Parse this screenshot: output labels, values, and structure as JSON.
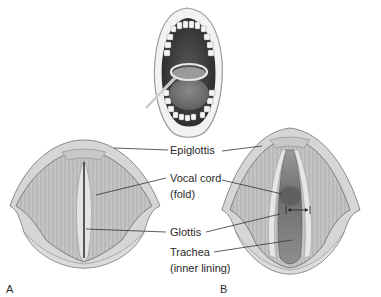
{
  "figure": {
    "panels": [
      {
        "id": "A",
        "label": "A",
        "state": "closed vocal cords"
      },
      {
        "id": "B",
        "label": "B",
        "state": "open vocal cords"
      }
    ],
    "labels": {
      "epiglottis": "Epiglottis",
      "vocal_cord_line1": "Vocal cord",
      "vocal_cord_line2": "(fold)",
      "glottis": "Glottis",
      "trachea_line1": "Trachea",
      "trachea_line2": "(inner lining)"
    },
    "inset": {
      "subject": "open mouth with laryngeal mirror"
    },
    "colors": {
      "tissue_light": "#d8d8d8",
      "tissue_mid": "#b8b8b8",
      "tissue_dark": "#7a7a7a",
      "mouth_dark": "#3a3a3a",
      "leader_line": "#333333",
      "text": "#2a2a2a"
    }
  }
}
